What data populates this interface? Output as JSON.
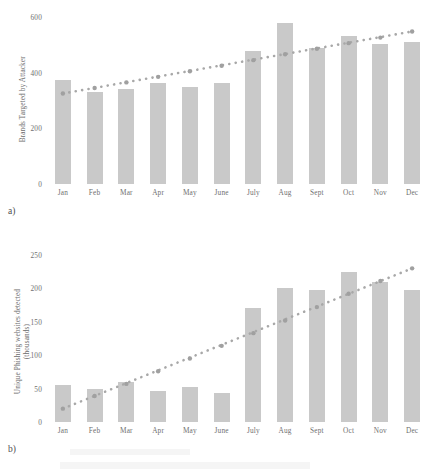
{
  "figure": {
    "panel_a_label": "a)",
    "panel_b_label": "b)"
  },
  "chart_data": [
    {
      "type": "bar",
      "id": "chart-a",
      "panel": "a)",
      "title": "",
      "xlabel": "",
      "ylabel": "Brands Targeted by Attacker",
      "ylabel_lines": [
        "Brands Targeted by Attacker"
      ],
      "categories": [
        "Jan",
        "Feb",
        "Mar",
        "Apr",
        "May",
        "June",
        "July",
        "Aug",
        "Sept",
        "Oct",
        "Nov",
        "Dec"
      ],
      "values": [
        375,
        330,
        343,
        362,
        350,
        362,
        478,
        578,
        490,
        530,
        502,
        512
      ],
      "ylim": [
        0,
        600
      ],
      "yticks": [
        0,
        200,
        400,
        600
      ],
      "ytick_labels": [
        "0",
        "200",
        "400",
        "600"
      ],
      "grid": false,
      "legend": "none",
      "bar_color": "#c9c9c9",
      "series": [
        {
          "name": "Brands Targeted by Attacker",
          "type": "bar",
          "values": [
            375,
            330,
            343,
            362,
            350,
            362,
            478,
            578,
            490,
            530,
            502,
            512
          ]
        },
        {
          "name": "Linear trendline",
          "type": "line",
          "style": "dotted",
          "color": "#a8a8a8",
          "values": [
            325,
            345,
            365,
            385,
            405,
            425,
            445,
            466,
            486,
            506,
            526,
            548
          ]
        }
      ]
    },
    {
      "type": "bar",
      "id": "chart-b",
      "panel": "b)",
      "title": "",
      "xlabel": "",
      "ylabel": "Unique Phishing websites detected (thousands)",
      "ylabel_lines": [
        "Unique Phishing websites detected",
        "(thousands)"
      ],
      "categories": [
        "Jan",
        "Feb",
        "Mar",
        "Apr",
        "May",
        "June",
        "July",
        "Aug",
        "Sept",
        "Oct",
        "Nov",
        "Dec"
      ],
      "values": [
        55,
        49,
        60,
        47,
        52,
        44,
        170,
        201,
        198,
        224,
        210,
        198
      ],
      "ylim": [
        0,
        250
      ],
      "yticks": [
        0,
        50,
        100,
        150,
        200,
        250
      ],
      "ytick_labels": [
        "0",
        "50",
        "100",
        "150",
        "200",
        "250"
      ],
      "grid": false,
      "legend": "none",
      "bar_color": "#c9c9c9",
      "series": [
        {
          "name": "Unique Phishing websites detected (thousands)",
          "type": "bar",
          "values": [
            55,
            49,
            60,
            47,
            52,
            44,
            170,
            201,
            198,
            224,
            210,
            198
          ]
        },
        {
          "name": "Linear trendline",
          "type": "line",
          "style": "dotted",
          "color": "#a8a8a8",
          "values": [
            20,
            39,
            57,
            76,
            95,
            114,
            133,
            152,
            172,
            192,
            211,
            230
          ]
        }
      ]
    }
  ]
}
